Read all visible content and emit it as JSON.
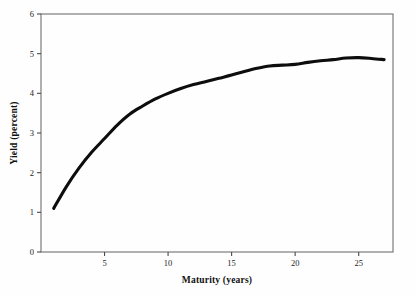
{
  "figure": {
    "background_color": "#fefefe",
    "line_color": "#0d0d0d",
    "frame_color": "#6f6f6f",
    "tick_color": "#4a4a4a"
  },
  "chart_data": {
    "type": "line",
    "title": "",
    "subtitle": "",
    "xlabel": "Maturity (years)",
    "ylabel": "Yield (percent)",
    "xlim": [
      0,
      27.7
    ],
    "ylim": [
      0,
      6
    ],
    "grid": false,
    "legend": null,
    "legend_position": "none",
    "xticks": [
      5,
      10,
      15,
      20,
      25
    ],
    "xtick_labels": [
      "5",
      "10",
      "15",
      "20",
      "25"
    ],
    "yticks": [
      0,
      1,
      2,
      3,
      4,
      5,
      6
    ],
    "ytick_labels": [
      "0",
      "1",
      "2",
      "3",
      "4",
      "5",
      "6"
    ],
    "series": [
      {
        "name": "yield curve",
        "color": "#0d0d0d",
        "x": [
          1,
          2,
          3,
          4,
          5,
          6,
          7,
          8,
          9,
          10,
          11,
          12,
          13,
          14,
          15,
          16,
          17,
          18,
          19,
          20,
          21,
          22,
          23,
          24,
          25,
          26,
          27
        ],
        "values": [
          1.1,
          1.65,
          2.12,
          2.52,
          2.86,
          3.2,
          3.48,
          3.68,
          3.86,
          4.0,
          4.12,
          4.22,
          4.3,
          4.38,
          4.46,
          4.55,
          4.63,
          4.69,
          4.71,
          4.73,
          4.78,
          4.82,
          4.85,
          4.89,
          4.9,
          4.88,
          4.85
        ]
      }
    ]
  },
  "axis_titles": {
    "x": "Maturity (years)",
    "y": "Yield (percent)"
  }
}
